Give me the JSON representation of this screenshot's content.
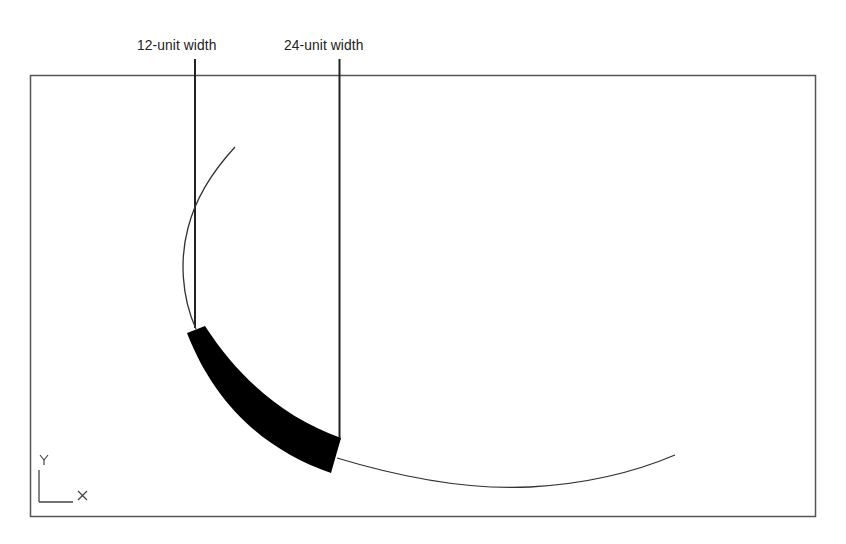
{
  "diagram": {
    "type": "polyline-width-illustration",
    "labels": [
      {
        "text": "12-unit width",
        "x": 137,
        "leader_x": 195
      },
      {
        "text": "24-unit width",
        "x": 284,
        "leader_x": 339
      }
    ],
    "ucs_icon": {
      "y_label": "Y",
      "x_label": "X"
    },
    "colors": {
      "line": "#222222",
      "frame": "#555555",
      "fill": "#000000"
    }
  }
}
